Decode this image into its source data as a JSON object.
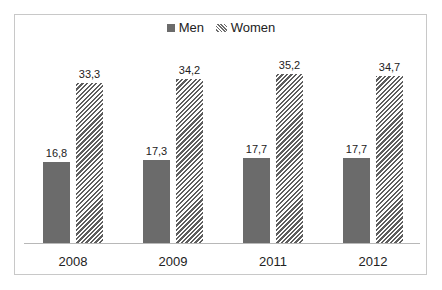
{
  "chart_data": {
    "type": "bar",
    "title": "",
    "xlabel": "",
    "ylabel": "",
    "categories": [
      "2008",
      "2009",
      "2011",
      "2012"
    ],
    "series": [
      {
        "name": "Men",
        "values": [
          16.8,
          17.3,
          17.7,
          17.7
        ],
        "labels": [
          "16,8",
          "17,3",
          "17,7",
          "17,7"
        ],
        "fill": "solid",
        "color": "#6b6b6b"
      },
      {
        "name": "Women",
        "values": [
          33.3,
          34.2,
          35.2,
          34.7
        ],
        "labels": [
          "33,3",
          "34,2",
          "35,2",
          "34,7"
        ],
        "fill": "diagonal-hatch",
        "color": "#5e5e5e"
      }
    ],
    "ylim": [
      0,
      40
    ],
    "grid": false,
    "legend_position": "top",
    "data_labels": true
  },
  "legend": {
    "items": [
      {
        "label": "Men",
        "icon": "solid-square-swatch"
      },
      {
        "label": "Women",
        "icon": "hatched-swatch"
      }
    ]
  }
}
